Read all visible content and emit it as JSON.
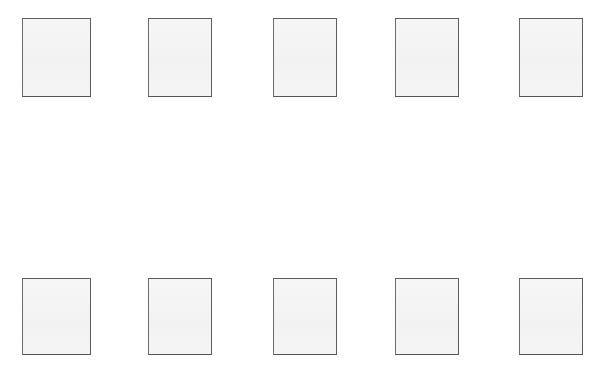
{
  "page": {
    "title": "",
    "background_color": "#ffffff",
    "width": 608,
    "height": 376
  },
  "style": {
    "box_fill_color": "#f4f4f4",
    "box_border_color": "#5c5c5c",
    "box_border_width": 1
  },
  "grid": {
    "rows": [
      {
        "name": "top-row",
        "top": 18,
        "height": 79,
        "boxes": [
          {
            "label": "",
            "left": 22,
            "width": 69,
            "height": 79
          },
          {
            "label": "",
            "left": 148,
            "width": 64,
            "height": 79
          },
          {
            "label": "",
            "left": 273,
            "width": 64,
            "height": 79
          },
          {
            "label": "",
            "left": 395,
            "width": 64,
            "height": 79
          },
          {
            "label": "",
            "left": 519,
            "width": 64,
            "height": 79
          }
        ]
      },
      {
        "name": "bottom-row",
        "top": 278,
        "height": 77,
        "boxes": [
          {
            "label": "",
            "left": 22,
            "width": 69,
            "height": 77
          },
          {
            "label": "",
            "left": 148,
            "width": 64,
            "height": 77
          },
          {
            "label": "",
            "left": 273,
            "width": 64,
            "height": 77
          },
          {
            "label": "",
            "left": 395,
            "width": 64,
            "height": 77
          },
          {
            "label": "",
            "left": 519,
            "width": 64,
            "height": 77
          }
        ]
      }
    ]
  }
}
